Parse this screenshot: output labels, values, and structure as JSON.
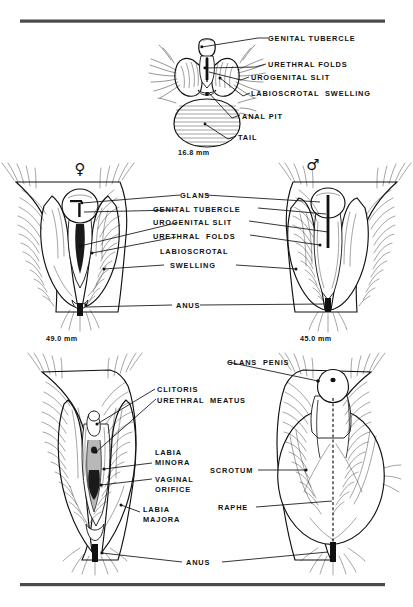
{
  "figure": {
    "background": "#ffffff",
    "ink_color": "#111111",
    "rule_color": "#4a4a4a"
  },
  "rules": {
    "top": "horizontal-rule",
    "bottom": "horizontal-rule"
  },
  "panels": [
    {
      "id": "indifferent-stage",
      "caption": "16.8 mm",
      "labels": [
        "GENITAL TUBERCLE",
        "URETHRAL FOLDS",
        "UROGENITAL SLIT",
        "LABIOSCROTAL SWELLING",
        "ANAL PIT",
        "TAIL"
      ]
    },
    {
      "id": "differentiating-stage",
      "female_symbol": "♀",
      "male_symbol": "♂",
      "female_caption": "49.0 mm",
      "male_caption": "45.0 mm",
      "labels": [
        "GLANS",
        "GENITAL TUBERCLE",
        "UROGENITAL SLIT",
        "URETHRAL FOLDS",
        "LABIOSCROTAL",
        "SWELLING",
        "ANUS"
      ]
    },
    {
      "id": "differentiated-stage",
      "female_labels": [
        "CLITORIS",
        "URETHRAL MEATUS",
        "LABIA",
        "MINORA",
        "VAGINAL",
        "ORIFICE",
        "LABIA",
        "MAJORA"
      ],
      "male_labels": [
        "GLANS PENIS",
        "SCROTUM",
        "RAPHE"
      ],
      "shared_labels": [
        "ANUS"
      ]
    }
  ],
  "text": {
    "genital_tubercle": "GENITAL TUBERCLE",
    "urethral_folds": "URETHRAL FOLDS",
    "urogenital_slit": "UROGENITAL SLIT",
    "labioscrotal_swelling": "LABIOSCROTAL  SWELLING",
    "anal_pit": "ANAL PIT",
    "tail": "TAIL",
    "size_168": "16.8 mm",
    "glans": "GLANS",
    "genital_tubercle_2": "GENITAL TUBERCLE",
    "urogenital_slit_2": "UROGENITAL SLIT",
    "urethral_folds_2": "URETHRAL  FOLDS",
    "labioscrotal": "LABIOSCROTAL",
    "swelling": "SWELLING",
    "anus_mid": "ANUS",
    "size_490": "49.0 mm",
    "size_450": "45.0 mm",
    "female_symbol": "♀",
    "male_symbol": "♂",
    "clitoris": "CLITORIS",
    "urethral_meatus": "URETHRAL  MEATUS",
    "labia": "LABIA",
    "minora": "MINORA",
    "vaginal": "VAGINAL",
    "orifice": "ORIFICE",
    "labia2": "LABIA",
    "majora": "MAJORA",
    "glans_penis": "GLANS  PENIS",
    "scrotum": "SCROTUM",
    "raphe": "RAPHE",
    "anus_bottom": "ANUS"
  }
}
